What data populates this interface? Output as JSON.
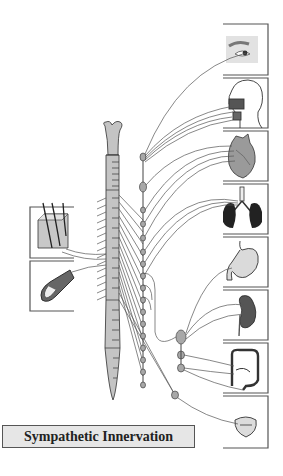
{
  "title": "Sympathetic Innervation",
  "colors": {
    "background": "#ffffff",
    "spinal_cord_fill": "#c4c4c4",
    "ganglion_fill": "#a8a8a8",
    "nerve_line": "#555555",
    "panel_border": "#555555",
    "title_fill": "#e6e6e6"
  },
  "diagram": {
    "central_structure": "spinal-cord",
    "chain": "sympathetic-trunk-ganglia",
    "collateral_ganglia": 4,
    "left_targets": [
      {
        "id": "skin",
        "label": "skin-hair-follicle"
      },
      {
        "id": "blood-vessel",
        "label": "blood-vessel"
      }
    ],
    "right_targets": [
      {
        "id": "eye",
        "label": "eye"
      },
      {
        "id": "salivary-glands",
        "label": "head-salivary-glands"
      },
      {
        "id": "heart",
        "label": "heart"
      },
      {
        "id": "lungs",
        "label": "lungs"
      },
      {
        "id": "stomach",
        "label": "stomach"
      },
      {
        "id": "kidney",
        "label": "kidney-adrenal"
      },
      {
        "id": "intestines",
        "label": "intestines"
      },
      {
        "id": "bladder",
        "label": "bladder"
      }
    ]
  }
}
